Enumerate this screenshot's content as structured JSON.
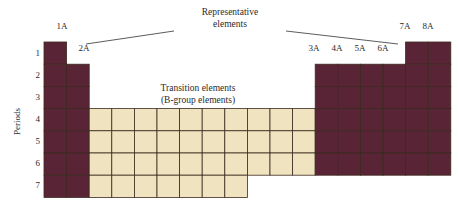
{
  "figure": {
    "title_representative": "Representative",
    "title_representative_line2": "elements",
    "title_transition": "Transition elements",
    "title_transition_line2": "(B-group elements)",
    "periods_axis_label": "Periods"
  },
  "colors": {
    "representative_fill": "#5a2437",
    "transition_fill": "#f0e4c0",
    "cell_stroke": "#3b2a20",
    "leader_line": "#4a4a4a",
    "text": "#2b2b2b",
    "background": "#ffffff"
  },
  "group_labels": [
    {
      "label": "1A",
      "x": 62,
      "y": 31
    },
    {
      "label": "2A",
      "x": 84,
      "y": 53
    },
    {
      "label": "3A",
      "x": 314,
      "y": 53
    },
    {
      "label": "4A",
      "x": 337,
      "y": 53
    },
    {
      "label": "5A",
      "x": 360,
      "y": 53
    },
    {
      "label": "6A",
      "x": 383,
      "y": 53
    },
    {
      "label": "7A",
      "x": 405,
      "y": 31
    },
    {
      "label": "8A",
      "x": 428,
      "y": 31
    }
  ],
  "period_labels": [
    {
      "label": "1",
      "y": 53
    },
    {
      "label": "2",
      "y": 75
    },
    {
      "label": "3",
      "y": 97
    },
    {
      "label": "4",
      "y": 119
    },
    {
      "label": "5",
      "y": 141
    },
    {
      "label": "6",
      "y": 163
    },
    {
      "label": "7",
      "y": 185
    }
  ],
  "chart_data": {
    "type": "diagram",
    "title": "Representative elements",
    "subtitle": "Transition elements (B-group elements)",
    "axis_label": "Periods",
    "periods": [
      1,
      2,
      3,
      4,
      5,
      6,
      7
    ],
    "groups": [
      "1A",
      "2A",
      "3A",
      "4A",
      "5A",
      "6A",
      "7A",
      "8A"
    ],
    "blocks": [
      {
        "name": "group-1A",
        "category": "representative",
        "color": "#5a2437",
        "col_start": 0,
        "col_count": 1,
        "period_start": 1,
        "period_end": 7
      },
      {
        "name": "group-2A",
        "category": "representative",
        "color": "#5a2437",
        "col_start": 1,
        "col_count": 1,
        "period_start": 2,
        "period_end": 7
      },
      {
        "name": "transition-block",
        "category": "transition",
        "color": "#f0e4c0",
        "col_start": 2,
        "col_count": 10,
        "period_start": 4,
        "period_end": 6
      },
      {
        "name": "transition-block-period7",
        "category": "transition",
        "color": "#f0e4c0",
        "col_start": 2,
        "col_count": 7,
        "period_start": 7,
        "period_end": 7
      },
      {
        "name": "groups-3A-6A",
        "category": "representative",
        "color": "#5a2437",
        "col_start": 12,
        "col_count": 4,
        "period_start": 2,
        "period_end": 6
      },
      {
        "name": "groups-7A-8A",
        "category": "representative",
        "color": "#5a2437",
        "col_start": 16,
        "col_count": 2,
        "period_start": 1,
        "period_end": 6
      }
    ]
  }
}
